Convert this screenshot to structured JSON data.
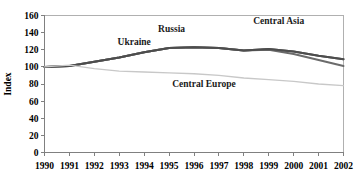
{
  "chart_data": {
    "type": "line",
    "title": "",
    "xlabel": "",
    "ylabel": "Index",
    "x": [
      1990,
      1991,
      1992,
      1993,
      1994,
      1995,
      1996,
      1997,
      1998,
      1999,
      2000,
      2001,
      2002
    ],
    "xlim": [
      1990,
      2002
    ],
    "ylim": [
      0,
      160
    ],
    "yticks": [
      0,
      20,
      40,
      60,
      80,
      100,
      120,
      140,
      160
    ],
    "xticks": [
      "1990",
      "1991",
      "1992",
      "1993",
      "1994",
      "1995",
      "1996",
      "1997",
      "1998",
      "1999",
      "2000",
      "2001",
      "2002"
    ],
    "grid": false,
    "legend": "inline-annotations",
    "series": [
      {
        "name": "Russia",
        "color": "#5a5a5a",
        "label_x": 1995.1,
        "label_y": 141,
        "values": [
          100,
          101,
          106,
          111,
          117,
          122,
          123,
          122,
          119,
          121,
          118,
          113,
          109
        ]
      },
      {
        "name": "Central Asia",
        "color": "#6b6b6b",
        "label_x": 1999.4,
        "label_y": 150,
        "values": [
          100,
          101,
          106,
          111,
          117,
          122,
          123,
          122,
          119,
          120,
          115,
          108,
          101
        ]
      },
      {
        "name": "Ukraine",
        "color": "#4d4d4d",
        "label_x": 1993.6,
        "label_y": 126,
        "values": [
          100,
          101,
          106,
          111,
          117,
          122,
          123,
          122,
          119,
          121,
          118,
          113,
          109
        ]
      },
      {
        "name": "Central Europe",
        "color": "#c8c8c8",
        "label_x": 1996.4,
        "label_y": 76,
        "values": [
          100,
          102,
          98,
          95,
          94,
          93,
          92,
          90,
          87,
          85,
          83,
          80,
          78
        ]
      }
    ]
  }
}
